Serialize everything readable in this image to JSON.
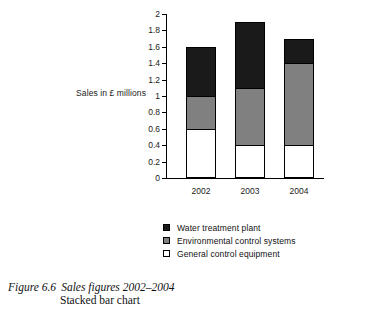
{
  "chart_data": {
    "type": "bar",
    "subtype": "stacked",
    "title": "",
    "xlabel": "",
    "ylabel": "Sales in £ millions",
    "categories": [
      "2002",
      "2003",
      "2004"
    ],
    "ylim": [
      0,
      2
    ],
    "ytick_step": 0.2,
    "yticks": [
      "0",
      "0.2",
      "0.4",
      "0.6",
      "0.8",
      "1",
      "1.2",
      "1.4",
      "1.6",
      "1.8",
      "2"
    ],
    "grid": false,
    "legend_position": "below",
    "series": [
      {
        "name": "General control equipment",
        "color": "#ffffff",
        "values": [
          0.6,
          0.4,
          0.4
        ]
      },
      {
        "name": "Environmental control systems",
        "color": "#808080",
        "values": [
          0.4,
          0.7,
          1.0
        ]
      },
      {
        "name": "Water treatment plant",
        "color": "#1a1a1a",
        "values": [
          0.6,
          0.8,
          0.3
        ]
      }
    ],
    "totals": [
      1.6,
      1.9,
      1.7
    ]
  },
  "legend": {
    "items": [
      {
        "label": "Water treatment plant",
        "color": "#1a1a1a"
      },
      {
        "label": "Environmental control systems",
        "color": "#808080"
      },
      {
        "label": "General control equipment",
        "color": "#ffffff"
      }
    ]
  },
  "caption": {
    "figure_number": "Figure 6.6",
    "title": "Sales figures 2002–2004",
    "subtitle": "Stacked bar chart"
  }
}
